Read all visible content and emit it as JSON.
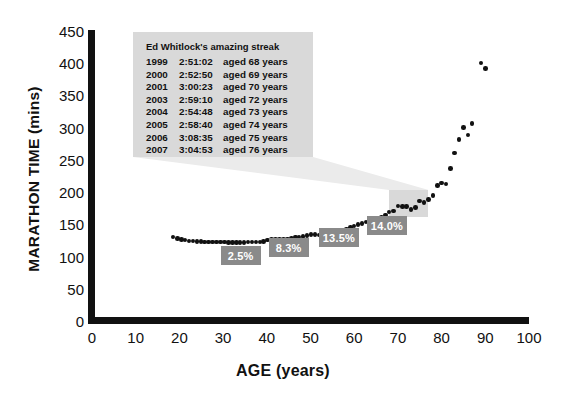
{
  "chart_data": {
    "type": "scatter",
    "title": "",
    "xlabel": "AGE (years)",
    "ylabel": "MARATHON TIME (mins)",
    "xlim": [
      0,
      100
    ],
    "ylim": [
      0,
      450
    ],
    "xticks": [
      0,
      10,
      20,
      30,
      40,
      50,
      60,
      70,
      80,
      90,
      100
    ],
    "yticks": [
      0,
      50,
      100,
      150,
      200,
      250,
      300,
      350,
      400,
      450
    ],
    "grid": false,
    "legend": "none",
    "series": [
      {
        "name": "World best marathon time by age",
        "points": [
          [
            18.5,
            132
          ],
          [
            19.5,
            130
          ],
          [
            20.5,
            128
          ],
          [
            21.3,
            127
          ],
          [
            22.2,
            126
          ],
          [
            23.1,
            126
          ],
          [
            24.0,
            125
          ],
          [
            24.9,
            125
          ],
          [
            25.8,
            124
          ],
          [
            26.7,
            124
          ],
          [
            27.6,
            124
          ],
          [
            28.5,
            124
          ],
          [
            29.4,
            124
          ],
          [
            30.3,
            124
          ],
          [
            31.2,
            123
          ],
          [
            32.1,
            123
          ],
          [
            33.0,
            123
          ],
          [
            33.9,
            123
          ],
          [
            34.8,
            123
          ],
          [
            35.7,
            124
          ],
          [
            36.6,
            124
          ],
          [
            37.5,
            124
          ],
          [
            38.4,
            124
          ],
          [
            39.3,
            125
          ],
          [
            40.2,
            127
          ],
          [
            41.1,
            128
          ],
          [
            42.0,
            128
          ],
          [
            42.9,
            128
          ],
          [
            43.8,
            128
          ],
          [
            44.7,
            129
          ],
          [
            45.6,
            130
          ],
          [
            46.5,
            132
          ],
          [
            47.4,
            132
          ],
          [
            48.3,
            133
          ],
          [
            49.2,
            134
          ],
          [
            50.1,
            136
          ],
          [
            51.0,
            136
          ],
          [
            51.9,
            135
          ],
          [
            52.8,
            137
          ],
          [
            53.7,
            138
          ],
          [
            54.6,
            139
          ],
          [
            55.5,
            141
          ],
          [
            56.4,
            142
          ],
          [
            57.3,
            143
          ],
          [
            58.2,
            144
          ],
          [
            59.1,
            147
          ],
          [
            60.0,
            149
          ],
          [
            60.9,
            151
          ],
          [
            61.8,
            153
          ],
          [
            62.7,
            155
          ],
          [
            63.6,
            158
          ],
          [
            64.5,
            159
          ],
          [
            65.4,
            160
          ],
          [
            66.3,
            162
          ],
          [
            67.2,
            166
          ],
          [
            68.0,
            171
          ],
          [
            69.0,
            172
          ],
          [
            70.0,
            180
          ],
          [
            71.0,
            179
          ],
          [
            72.0,
            179
          ],
          [
            73.0,
            175
          ],
          [
            74.0,
            178
          ],
          [
            75.0,
            188
          ],
          [
            76.0,
            185
          ],
          [
            77.0,
            190
          ],
          [
            78.0,
            196
          ],
          [
            79.0,
            212
          ],
          [
            80.0,
            216
          ],
          [
            81.0,
            214
          ],
          [
            82.0,
            238
          ],
          [
            83.0,
            262
          ],
          [
            84.0,
            283
          ],
          [
            85.0,
            302
          ],
          [
            86.0,
            290
          ],
          [
            87.0,
            308
          ],
          [
            89.0,
            402
          ],
          [
            90.0,
            393
          ]
        ]
      }
    ],
    "annotations": {
      "decline_badges": [
        {
          "label": "2.5%",
          "x_pct": 34.0,
          "y_px": 246
        },
        {
          "label": "8.3%",
          "x_pct": 45.0,
          "y_px": 238
        },
        {
          "label": "13.5%",
          "x_pct": 56.5,
          "y_px": 228
        },
        {
          "label": "14.0%",
          "x_pct": 67.5,
          "y_px": 216
        }
      ],
      "highlight_region": {
        "x_start": 68,
        "x_end": 77,
        "y_start": 163,
        "y_end": 205
      }
    }
  },
  "callout": {
    "title": "Ed Whitlock's amazing streak",
    "rows": [
      {
        "year": "1999",
        "time": "2:51:02",
        "aged": "aged 68 years"
      },
      {
        "year": "2000",
        "time": "2:52:50",
        "aged": "aged 69 years"
      },
      {
        "year": "2001",
        "time": "3:00:23",
        "aged": "aged 70 years"
      },
      {
        "year": "2003",
        "time": "2:59:10",
        "aged": "aged 72 years"
      },
      {
        "year": "2004",
        "time": "2:54:48",
        "aged": "aged 73 years"
      },
      {
        "year": "2005",
        "time": "2:58:40",
        "aged": "aged 74 years"
      },
      {
        "year": "2006",
        "time": "3:08:35",
        "aged": "aged 75 years"
      },
      {
        "year": "2007",
        "time": "3:04:53",
        "aged": "aged 76 years"
      }
    ]
  },
  "colors": {
    "background": "#ffffff",
    "axis": "#111111",
    "dot": "#111111",
    "callout_bg": "#d9d9d9",
    "badge_bg": "#8a8a8a",
    "badge_text": "#ffffff",
    "leader_fill": "#e8e8e8"
  }
}
